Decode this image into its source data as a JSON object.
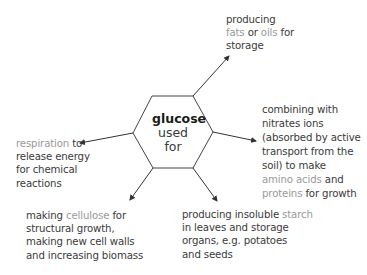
{
  "center": {
    "title": "glucose",
    "line2": "used",
    "line3": "for"
  },
  "branches": {
    "fats": {
      "lines": [
        [
          {
            "t": "producing",
            "hl": false
          }
        ],
        [
          {
            "t": "fats",
            "hl": true
          },
          {
            "t": " or ",
            "hl": false
          },
          {
            "t": "oils",
            "hl": true
          },
          {
            "t": " for",
            "hl": false
          }
        ],
        [
          {
            "t": "storage",
            "hl": false
          }
        ]
      ]
    },
    "proteins": {
      "lines": [
        [
          {
            "t": "combining with",
            "hl": false
          }
        ],
        [
          {
            "t": "nitrates ions",
            "hl": false
          }
        ],
        [
          {
            "t": "(absorbed by active",
            "hl": false
          }
        ],
        [
          {
            "t": "transport from the",
            "hl": false
          }
        ],
        [
          {
            "t": "soil) to make",
            "hl": false
          }
        ],
        [
          {
            "t": "amino acids",
            "hl": true
          },
          {
            "t": " and",
            "hl": false
          }
        ],
        [
          {
            "t": "proteins",
            "hl": true
          },
          {
            "t": " for growth",
            "hl": false
          }
        ]
      ]
    },
    "respiration": {
      "lines": [
        [
          {
            "t": "respiration",
            "hl": true
          },
          {
            "t": " to",
            "hl": false
          }
        ],
        [
          {
            "t": "release energy",
            "hl": false
          }
        ],
        [
          {
            "t": "for chemical",
            "hl": false
          }
        ],
        [
          {
            "t": "reactions",
            "hl": false
          }
        ]
      ]
    },
    "cellulose": {
      "lines": [
        [
          {
            "t": "making ",
            "hl": false
          },
          {
            "t": "cellulose",
            "hl": true
          },
          {
            "t": " for",
            "hl": false
          }
        ],
        [
          {
            "t": "structural growth,",
            "hl": false
          }
        ],
        [
          {
            "t": "making new cell walls",
            "hl": false
          }
        ],
        [
          {
            "t": "and increasing biomass",
            "hl": false
          }
        ]
      ]
    },
    "starch": {
      "lines": [
        [
          {
            "t": "producing insoluble ",
            "hl": false
          },
          {
            "t": "starch",
            "hl": true
          }
        ],
        [
          {
            "t": "in leaves and storage",
            "hl": false
          }
        ],
        [
          {
            "t": "organs, e.g. potatoes",
            "hl": false
          }
        ],
        [
          {
            "t": "and seeds",
            "hl": false
          }
        ]
      ]
    }
  },
  "colors": {
    "text": "#3a3a3a",
    "highlight": "#9a9a9a",
    "line": "#333333"
  }
}
